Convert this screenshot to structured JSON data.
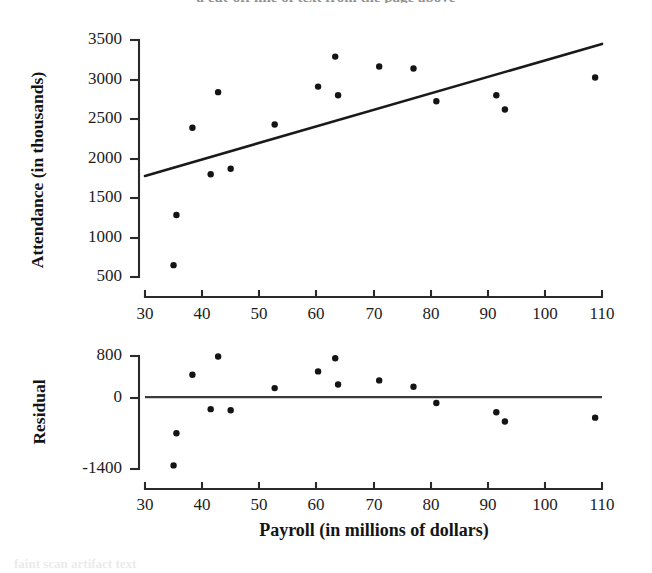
{
  "figure": {
    "scan_bleed_top": "a cut-off line of text from the page above",
    "scan_bleed_bottom": "faint scan artifact text"
  },
  "chart_data": [
    {
      "id": "scatter",
      "type": "scatter",
      "title": "",
      "xlabel": "",
      "ylabel": "Attendance (in thousands)",
      "xlim": [
        30,
        110
      ],
      "ylim": [
        500,
        3500
      ],
      "xticks": [
        30,
        40,
        50,
        60,
        70,
        80,
        90,
        100,
        110
      ],
      "xtick_labels": [
        "30",
        "40",
        "50",
        "60",
        "70",
        "80",
        "90",
        "100",
        "110"
      ],
      "yticks": [
        500,
        1000,
        1500,
        2000,
        2500,
        3000,
        3500
      ],
      "ytick_labels": [
        "500",
        "1000",
        "1500",
        "2000",
        "2500",
        "3000",
        "3500"
      ],
      "grid": false,
      "legend": "none",
      "marker": "filled-circle",
      "marker_color": "#141414",
      "x": [
        35.0,
        35.5,
        38.3,
        41.5,
        42.8,
        45.0,
        52.7,
        60.3,
        63.3,
        63.8,
        71.0,
        77.0,
        81.0,
        91.5,
        93.0,
        108.8
      ],
      "y": [
        650,
        1285,
        2390,
        1800,
        2840,
        1870,
        2430,
        2910,
        3290,
        2800,
        3165,
        3140,
        2725,
        2800,
        2620,
        3025
      ],
      "fit_line": {
        "type": "least-squares-regression",
        "color": "#1a1a1a",
        "x_endpoints": [
          30,
          110
        ],
        "y_endpoints": [
          1780,
          3450
        ],
        "slope": 20.9,
        "intercept": 1153
      }
    },
    {
      "id": "residual",
      "type": "scatter",
      "title": "",
      "xlabel": "Payroll (in millions of dollars)",
      "ylabel": "Residual",
      "xlim": [
        30,
        110
      ],
      "ylim": [
        -1400,
        800
      ],
      "xticks": [
        30,
        40,
        50,
        60,
        70,
        80,
        90,
        100,
        110
      ],
      "xtick_labels": [
        "30",
        "40",
        "50",
        "60",
        "70",
        "80",
        "90",
        "100",
        "110"
      ],
      "yticks": [
        -1400,
        0,
        800
      ],
      "ytick_labels": [
        "-1400",
        "0",
        "800"
      ],
      "grid": false,
      "legend": "none",
      "marker": "filled-circle",
      "marker_color": "#141414",
      "zero_reference_line": 0,
      "x": [
        35.0,
        35.5,
        38.3,
        41.5,
        42.8,
        45.0,
        52.7,
        60.3,
        63.3,
        63.8,
        71.0,
        77.0,
        81.0,
        91.5,
        93.0,
        108.8
      ],
      "y": [
        -1330,
        -705,
        435,
        -235,
        790,
        -255,
        175,
        500,
        755,
        245,
        325,
        200,
        -115,
        -295,
        -475,
        -400
      ]
    }
  ]
}
